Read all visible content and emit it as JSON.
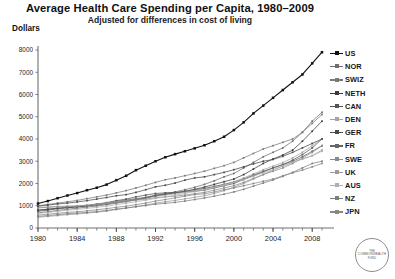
{
  "header": {
    "title": "Average Health Care Spending per Capita, 1980–2009",
    "subtitle": "Adjusted for differences in cost of living",
    "unit_label": "Dollars"
  },
  "logo": {
    "line1": "THE",
    "line2": "COMMONWEALTH",
    "line3": "FUND"
  },
  "chart_data": {
    "type": "line",
    "title": "Average Health Care Spending per Capita, 1980–2009",
    "subtitle": "Adjusted for differences in cost of living",
    "xlabel": "",
    "ylabel": "Dollars",
    "xlim": [
      1980,
      2009
    ],
    "ylim": [
      0,
      8000
    ],
    "yticks": [
      0,
      1000,
      2000,
      3000,
      4000,
      5000,
      6000,
      7000,
      8000
    ],
    "ytick_labels": [
      "0",
      "1000",
      "2000",
      "3000",
      "4000",
      "5000",
      "6000",
      "7000",
      "8000"
    ],
    "xticks": [
      1980,
      1984,
      1988,
      1992,
      1996,
      2000,
      2004,
      2008
    ],
    "xtick_labels": [
      "1980",
      "1984",
      "1988",
      "1992",
      "1996",
      "2000",
      "2004",
      "2008"
    ],
    "minor_xticks_every": 1,
    "grid": false,
    "legend_position": "right",
    "marker": "square",
    "x": [
      1980,
      1981,
      1982,
      1983,
      1984,
      1985,
      1986,
      1987,
      1988,
      1989,
      1990,
      1991,
      1992,
      1993,
      1994,
      1995,
      1996,
      1997,
      1998,
      1999,
      2000,
      2001,
      2002,
      2003,
      2004,
      2005,
      2006,
      2007,
      2008,
      2009
    ],
    "series": [
      {
        "name": "US",
        "color": "#111111",
        "values": [
          1100,
          1210,
          1340,
          1460,
          1570,
          1700,
          1810,
          1950,
          2150,
          2350,
          2600,
          2800,
          3000,
          3180,
          3320,
          3450,
          3580,
          3720,
          3900,
          4100,
          4400,
          4750,
          5150,
          5500,
          5850,
          6200,
          6550,
          6900,
          7400,
          7900
        ]
      },
      {
        "name": "NOR",
        "color": "#6e6e6e",
        "values": [
          800,
          850,
          890,
          930,
          960,
          1000,
          1060,
          1120,
          1200,
          1260,
          1320,
          1380,
          1480,
          1550,
          1620,
          1720,
          1830,
          1960,
          2120,
          2300,
          2450,
          2700,
          2950,
          3200,
          3400,
          3600,
          3900,
          4300,
          4800,
          5200
        ]
      },
      {
        "name": "SWIZ",
        "color": "#7a7a7a",
        "values": [
          1000,
          1060,
          1120,
          1180,
          1240,
          1320,
          1400,
          1480,
          1580,
          1680,
          1800,
          1920,
          2050,
          2170,
          2250,
          2350,
          2450,
          2550,
          2680,
          2800,
          2950,
          3150,
          3350,
          3550,
          3700,
          3850,
          4000,
          4300,
          4700,
          5100
        ]
      },
      {
        "name": "NETH",
        "color": "#3a3a3a",
        "values": [
          800,
          840,
          880,
          910,
          950,
          990,
          1040,
          1090,
          1160,
          1220,
          1290,
          1360,
          1450,
          1520,
          1580,
          1650,
          1740,
          1840,
          1960,
          2080,
          2200,
          2400,
          2650,
          2900,
          3100,
          3280,
          3500,
          3900,
          4350,
          4800
        ]
      },
      {
        "name": "CAN",
        "color": "#555555",
        "values": [
          750,
          800,
          870,
          920,
          960,
          1010,
          1080,
          1140,
          1230,
          1300,
          1400,
          1480,
          1550,
          1580,
          1600,
          1620,
          1650,
          1700,
          1800,
          1900,
          2000,
          2180,
          2350,
          2520,
          2700,
          2850,
          3050,
          3300,
          3600,
          4000
        ]
      },
      {
        "name": "DEN",
        "color": "#a4a4a4",
        "values": [
          920,
          950,
          970,
          990,
          1000,
          1030,
          1070,
          1120,
          1180,
          1220,
          1290,
          1350,
          1420,
          1480,
          1530,
          1600,
          1680,
          1760,
          1860,
          1960,
          2080,
          2250,
          2430,
          2620,
          2780,
          2940,
          3150,
          3400,
          3700,
          4000
        ]
      },
      {
        "name": "GER",
        "color": "#4a4a4a",
        "values": [
          980,
          1030,
          1080,
          1120,
          1170,
          1230,
          1300,
          1370,
          1450,
          1500,
          1600,
          1720,
          1850,
          1920,
          2020,
          2150,
          2250,
          2300,
          2400,
          2500,
          2620,
          2750,
          2880,
          3000,
          3080,
          3220,
          3400,
          3600,
          3800,
          4000
        ]
      },
      {
        "name": "FR",
        "color": "#666666",
        "values": [
          680,
          730,
          790,
          840,
          890,
          940,
          990,
          1050,
          1120,
          1180,
          1270,
          1350,
          1450,
          1520,
          1580,
          1650,
          1720,
          1780,
          1870,
          1960,
          2060,
          2200,
          2380,
          2550,
          2700,
          2850,
          3000,
          3200,
          3450,
          3700
        ]
      },
      {
        "name": "SWE",
        "color": "#8a8a8a",
        "values": [
          900,
          930,
          950,
          960,
          980,
          1010,
          1050,
          1100,
          1160,
          1200,
          1250,
          1300,
          1360,
          1400,
          1430,
          1480,
          1540,
          1600,
          1700,
          1800,
          1900,
          2050,
          2230,
          2400,
          2550,
          2700,
          2900,
          3150,
          3400,
          3700
        ]
      },
      {
        "name": "UK",
        "color": "#9a9a9a",
        "values": [
          480,
          520,
          560,
          600,
          630,
          670,
          710,
          760,
          830,
          890,
          960,
          1030,
          1120,
          1180,
          1240,
          1310,
          1380,
          1450,
          1550,
          1680,
          1830,
          2000,
          2200,
          2400,
          2600,
          2800,
          2950,
          3100,
          3250,
          3500
        ]
      },
      {
        "name": "AUS",
        "color": "#b0b0b0",
        "values": [
          660,
          700,
          750,
          800,
          840,
          880,
          930,
          980,
          1050,
          1110,
          1180,
          1250,
          1330,
          1400,
          1470,
          1550,
          1640,
          1720,
          1820,
          1930,
          2050,
          2180,
          2330,
          2480,
          2620,
          2780,
          2950,
          3100,
          3250,
          3450
        ]
      },
      {
        "name": "NZ",
        "color": "#7d7d7d",
        "values": [
          520,
          560,
          600,
          640,
          670,
          700,
          740,
          790,
          850,
          900,
          960,
          1010,
          1070,
          1110,
          1150,
          1210,
          1280,
          1350,
          1430,
          1520,
          1620,
          1740,
          1880,
          2020,
          2160,
          2320,
          2500,
          2700,
          2900,
          3000
        ]
      },
      {
        "name": "JPN",
        "color": "#888888",
        "values": [
          580,
          620,
          660,
          700,
          730,
          770,
          820,
          870,
          930,
          980,
          1050,
          1120,
          1210,
          1280,
          1350,
          1430,
          1500,
          1540,
          1620,
          1720,
          1800,
          1900,
          2000,
          2100,
          2200,
          2350,
          2480,
          2600,
          2750,
          2900
        ]
      }
    ]
  }
}
